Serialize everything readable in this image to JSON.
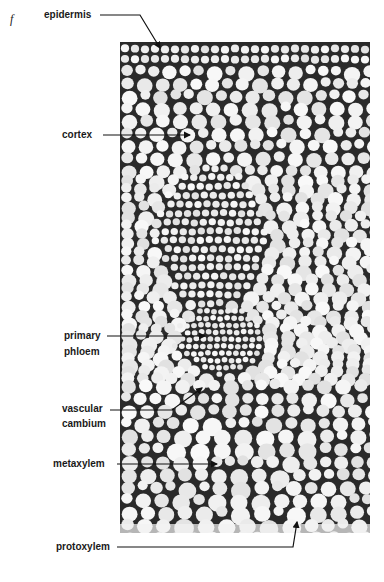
{
  "figure": {
    "panel_letter": "f",
    "labels": {
      "epidermis": "epidermis",
      "cortex": "cortex",
      "primary_phloem_1": "primary",
      "primary_phloem_2": "phloem",
      "vascular_cambium_1": "vascular",
      "vascular_cambium_2": "cambium",
      "metaxylem": "metaxylem",
      "protoxylem": "protoxylem"
    }
  }
}
